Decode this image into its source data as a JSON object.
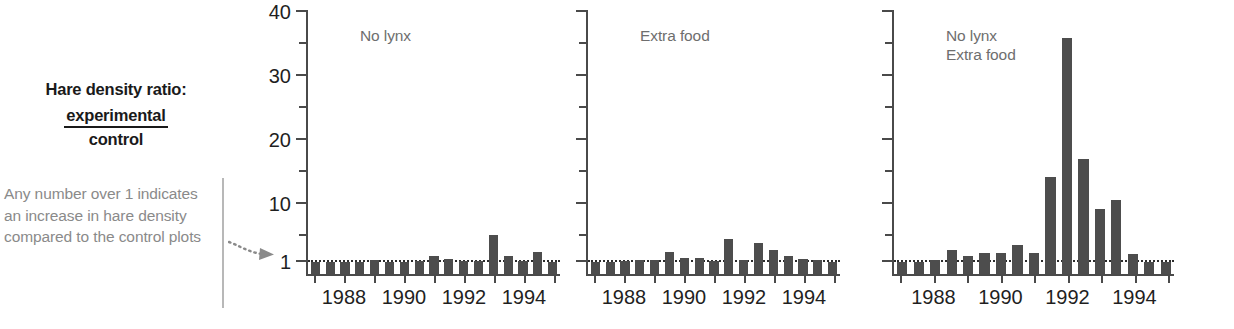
{
  "caption": {
    "title": "Hare density ratio:",
    "numerator": "experimental",
    "denominator": "control",
    "note": "Any number over 1 indicates an increase in hare density compared to the control plots"
  },
  "colors": {
    "bar": "#4d4d4d",
    "axis": "#4a4a4a",
    "title_text": "#6e6e6e",
    "note_text": "#8a8a8a",
    "refline": "#2b2b2b"
  },
  "chart_data": {
    "type": "bar",
    "xlabel": "",
    "ylabel": "Hare density ratio (experimental/control)",
    "ylim": [
      1,
      40
    ],
    "yscale": "log-like broken axis",
    "ytick_labels": [
      "1",
      "10",
      "20",
      "30",
      "40"
    ],
    "ytick_values": [
      1,
      10,
      20,
      30,
      40
    ],
    "yminor_values": [
      5,
      15,
      25,
      35
    ],
    "grid": false,
    "legend": "none",
    "reference_line": 1,
    "reference_line_style": "dotted",
    "x": [
      1987,
      1987.5,
      1988,
      1988.5,
      1989,
      1989.5,
      1990,
      1990.5,
      1991,
      1991.5,
      1992,
      1992.5,
      1993,
      1993.5,
      1994,
      1994.5,
      1995
    ],
    "xtick_values": [
      1987,
      1988,
      1989,
      1990,
      1991,
      1992,
      1993,
      1994,
      1995
    ],
    "xtick_labels": [
      "",
      "1988",
      "",
      "1990",
      "",
      "1992",
      "",
      "1994",
      ""
    ],
    "panels": [
      {
        "name": "no-lynx",
        "title": "No lynx",
        "values": [
          1.0,
          1.0,
          1.05,
          1.05,
          1.3,
          1.0,
          1.0,
          1.1,
          1.9,
          1.5,
          1.1,
          1.15,
          5.2,
          1.9,
          1.1,
          2.6,
          1.05
        ]
      },
      {
        "name": "extra-food",
        "title": "Extra food",
        "values": [
          1.0,
          1.0,
          1.15,
          1.3,
          1.35,
          2.6,
          1.7,
          1.7,
          1.2,
          4.6,
          1.25,
          3.9,
          2.9,
          1.9,
          1.4,
          1.3,
          1.0
        ]
      },
      {
        "name": "no-lynx-extra-food",
        "title": "No lynx\nExtra food",
        "values": [
          1.0,
          1.0,
          1.3,
          2.9,
          2.0,
          2.4,
          2.4,
          3.6,
          2.4,
          14.3,
          36.0,
          17.0,
          9.2,
          10.6,
          2.2,
          1.0,
          1.0
        ]
      }
    ]
  }
}
